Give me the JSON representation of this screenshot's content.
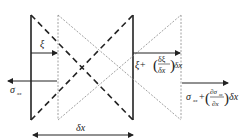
{
  "diagram": {
    "type": "element-deformation",
    "labels": {
      "xi": "ξ",
      "xi_plus": "ξ+",
      "frac_num": "δξ",
      "frac_den": "δx",
      "dx_after_frac": "δx",
      "sigma_left": "σ",
      "sigma_left_sub": "xx",
      "sigma_right": "σ",
      "sigma_right_sub": "xx",
      "sigma_right_plus": "+",
      "dsig_num": "∂σ",
      "dsig_num_sub": "xx",
      "dsig_den": "∂x",
      "dsig_dx": "δx",
      "delta_x": "δx"
    },
    "colors": {
      "solid": "#222222",
      "dotted": "#888888"
    }
  }
}
